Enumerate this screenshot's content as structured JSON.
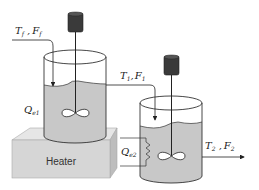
{
  "diagram": {
    "type": "process-diagram",
    "labels": {
      "feed": {
        "T": "T",
        "T_sub": "f",
        "sep": " ,",
        "F": "F",
        "F_sub": "f"
      },
      "stream1": {
        "T": "T",
        "T_sub": "1",
        "sep": ",",
        "F": "F",
        "F_sub": "1"
      },
      "stream2": {
        "T": "T",
        "T_sub": "2",
        "sep": " ,",
        "F": "F",
        "F_sub": "2"
      },
      "heat1": {
        "Q": "Q",
        "Q_sub": "e1"
      },
      "heat2": {
        "Q": "Q",
        "Q_sub": "e2"
      },
      "heater": "Heater"
    },
    "colors": {
      "liquid": "#c8c8c8",
      "motor": "#3a3a3a",
      "heater_front": "#d6d6d6",
      "heater_top": "#e6e6e6",
      "heater_side": "#bdbdbd",
      "stroke": "#333333"
    }
  }
}
